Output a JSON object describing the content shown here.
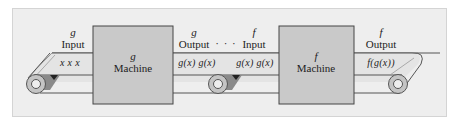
{
  "diagram": {
    "type": "function composition conveyor",
    "colors": {
      "panel": "#eeeeee",
      "belt_top": "#e2e2e2",
      "belt_edge": "#555555",
      "machine_fill": "#c9c9c9",
      "machine_border": "#444444",
      "roller": "#bdbdbd"
    },
    "g_input": {
      "fn": "g",
      "label": "Input",
      "belt": "x  x  x"
    },
    "g_machine": {
      "fn": "g",
      "label": "Machine"
    },
    "g_output": {
      "fn": "g",
      "label": "Output",
      "belt": "g(x)  g(x)"
    },
    "ellipsis": "· · ·",
    "f_input": {
      "fn": "f",
      "label": "Input",
      "belt": "g(x)  g(x)"
    },
    "f_machine": {
      "fn": "f",
      "label": "Machine"
    },
    "f_output": {
      "fn": "f",
      "label": "Output",
      "belt": "f(g(x))"
    }
  }
}
